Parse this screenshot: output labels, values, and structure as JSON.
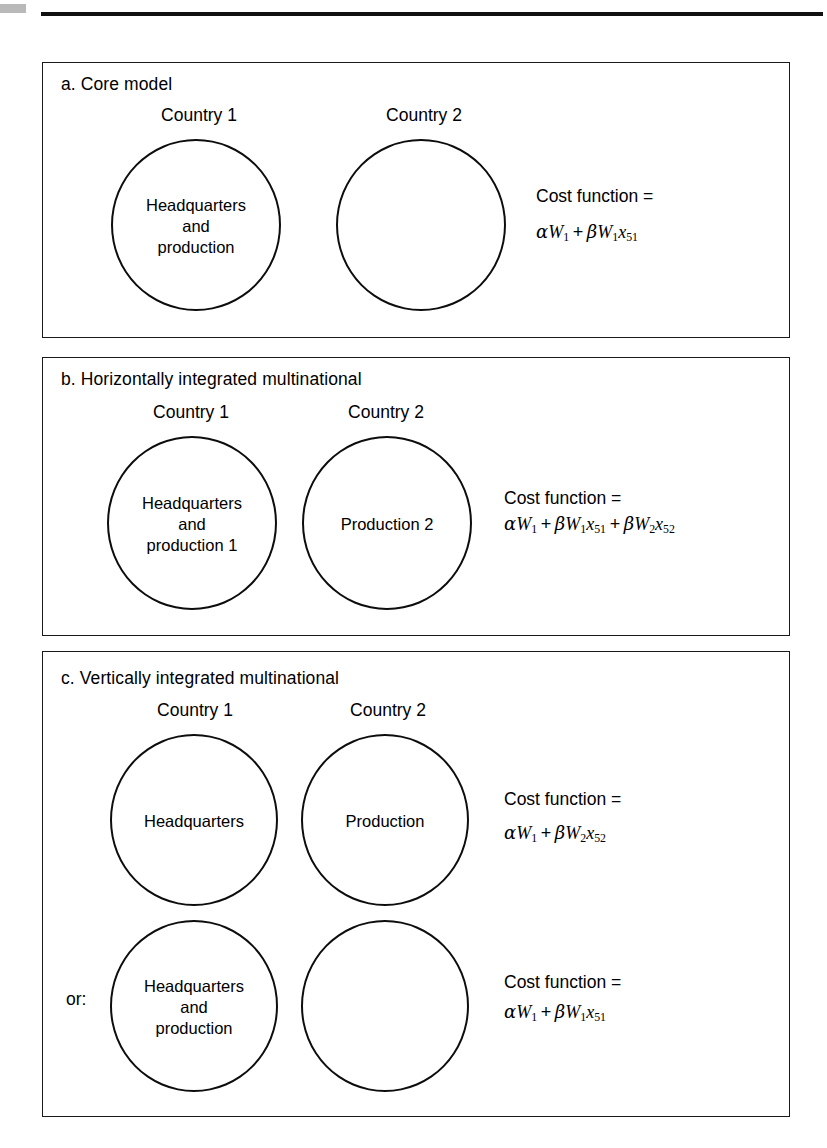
{
  "figure": {
    "panels": [
      {
        "id": "a",
        "title": "a. Core model",
        "country_labels": [
          "Country 1",
          "Country 2"
        ],
        "ellipses": [
          {
            "label": "Headquarters\nand\nproduction"
          },
          {
            "label": ""
          }
        ],
        "cost": {
          "label": "Cost function =",
          "formula_parts": [
            {
              "greek": "α",
              "var": "W",
              "sub": "1"
            },
            {
              "op": "+"
            },
            {
              "greek": "β",
              "var": "W",
              "sub": "1"
            },
            {
              "var": "x",
              "sub": "51"
            }
          ],
          "formula_text": "αW₁ + βW₁x₅₁"
        }
      },
      {
        "id": "b",
        "title": "b. Horizontally integrated multinational",
        "country_labels": [
          "Country 1",
          "Country 2"
        ],
        "ellipses": [
          {
            "label": "Headquarters\nand\nproduction 1"
          },
          {
            "label": "Production 2"
          }
        ],
        "cost": {
          "label": "Cost function =",
          "formula_text": "αW₁ + βW₁x₅₁ + βW₂x₅₂"
        }
      },
      {
        "id": "c",
        "title": "c. Vertically integrated multinational",
        "country_labels": [
          "Country 1",
          "Country 2"
        ],
        "or_label": "or:",
        "rows": [
          {
            "ellipses": [
              {
                "label": "Headquarters"
              },
              {
                "label": "Production"
              }
            ],
            "cost": {
              "label": "Cost function =",
              "formula_text": "αW₁ + βW₂x₅₂"
            }
          },
          {
            "ellipses": [
              {
                "label": "Headquarters\nand\nproduction"
              },
              {
                "label": ""
              }
            ],
            "cost": {
              "label": "Cost function =",
              "formula_text": "αW₁ + βW₁x₅₁"
            }
          }
        ]
      }
    ],
    "colors": {
      "ink": "#0d0d0d",
      "panel_border": "#1a1a1a",
      "rule": "#111111",
      "edge_mark": "#b9b9b9",
      "background": "#ffffff"
    }
  }
}
